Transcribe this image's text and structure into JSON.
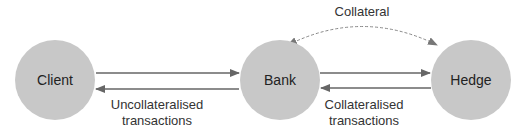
{
  "diagram": {
    "nodes": [
      {
        "id": "client",
        "label": "Client"
      },
      {
        "id": "bank",
        "label": "Bank"
      },
      {
        "id": "hedge",
        "label": "Hedge"
      }
    ],
    "edges": [
      {
        "from": "client",
        "to": "bank",
        "style": "solid",
        "label": "Uncollateralised transactions"
      },
      {
        "from": "bank",
        "to": "client",
        "style": "solid",
        "label": "Uncollateralised transactions"
      },
      {
        "from": "bank",
        "to": "hedge",
        "style": "solid",
        "label": "Collateralised transactions"
      },
      {
        "from": "hedge",
        "to": "bank",
        "style": "solid",
        "label": "Collateralised transactions"
      },
      {
        "from": "bank",
        "to": "hedge",
        "style": "dashed-bidirectional",
        "label": "Collateral"
      }
    ],
    "labels": {
      "collateral": "Collateral",
      "uncollateralised_line1": "Uncollateralised",
      "uncollateralised_line2": "transactions",
      "collateralised_line1": "Collateralised",
      "collateralised_line2": "transactions"
    },
    "colors": {
      "node_fill": "#c8c8c8",
      "arrow": "#666666",
      "dashed_arrow": "#888888",
      "text": "#333333"
    }
  }
}
